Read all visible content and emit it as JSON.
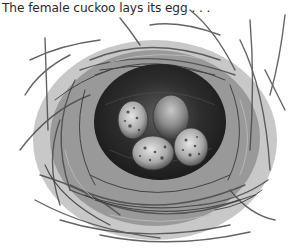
{
  "caption": "The female cuckoo lays its egg . . .",
  "illustration": {
    "subject": "bird-nest-with-eggs",
    "egg_count": 4,
    "colors": {
      "background": "#ffffff",
      "nest_dark": "#2b2b2b",
      "nest_mid": "#6a6a6a",
      "nest_light": "#a8a8a8",
      "egg_plain": "#8a8a8a",
      "egg_speckled": "#b5b5b5"
    }
  }
}
